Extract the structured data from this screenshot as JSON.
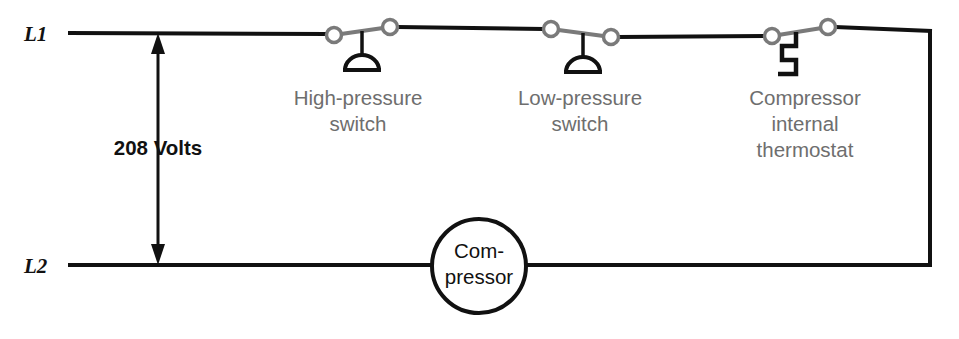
{
  "diagram": {
    "colors": {
      "wire": "#111111",
      "switch_gray": "#7a7a7a",
      "label_gray": "#6e6e6e",
      "text_black": "#111111",
      "background": "#ffffff"
    },
    "buses": [
      {
        "id": "L1",
        "label": "L1",
        "y": 33
      },
      {
        "id": "L2",
        "label": "L2",
        "y": 265
      }
    ],
    "voltage": {
      "label": "208 Volts",
      "x": 158,
      "top_y": 33,
      "bottom_y": 265
    },
    "switches": [
      {
        "id": "high-pressure-switch",
        "type": "pressure-switch",
        "label_lines": [
          "High-pressure",
          "switch"
        ],
        "label_center_x": 358,
        "label_top_y": 89,
        "left_terminal_x": 334,
        "left_terminal_y": 35,
        "right_terminal_x": 390,
        "right_terminal_y": 27,
        "stem_x": 362,
        "element": "bellows"
      },
      {
        "id": "low-pressure-switch",
        "type": "pressure-switch",
        "label_lines": [
          "Low-pressure",
          "switch"
        ],
        "label_center_x": 580,
        "label_top_y": 89,
        "left_terminal_x": 551,
        "left_terminal_y": 29,
        "right_terminal_x": 611,
        "right_terminal_y": 37,
        "stem_x": 583,
        "element": "bellows"
      },
      {
        "id": "compressor-internal-thermostat",
        "type": "thermostat-switch",
        "label_lines": [
          "Compressor",
          "internal",
          "thermostat"
        ],
        "label_center_x": 805,
        "label_top_y": 89,
        "left_terminal_x": 772,
        "left_terminal_y": 36,
        "right_terminal_x": 828,
        "right_terminal_y": 27,
        "stem_x": 796,
        "element": "bimetal-zigzag"
      }
    ],
    "load": {
      "id": "compressor",
      "label_lines": [
        "Com-",
        "pressor"
      ],
      "center_x": 479,
      "center_y": 266,
      "radius": 47
    },
    "return_wire": {
      "x": 930,
      "top_y": 33,
      "bottom_y": 265
    }
  }
}
